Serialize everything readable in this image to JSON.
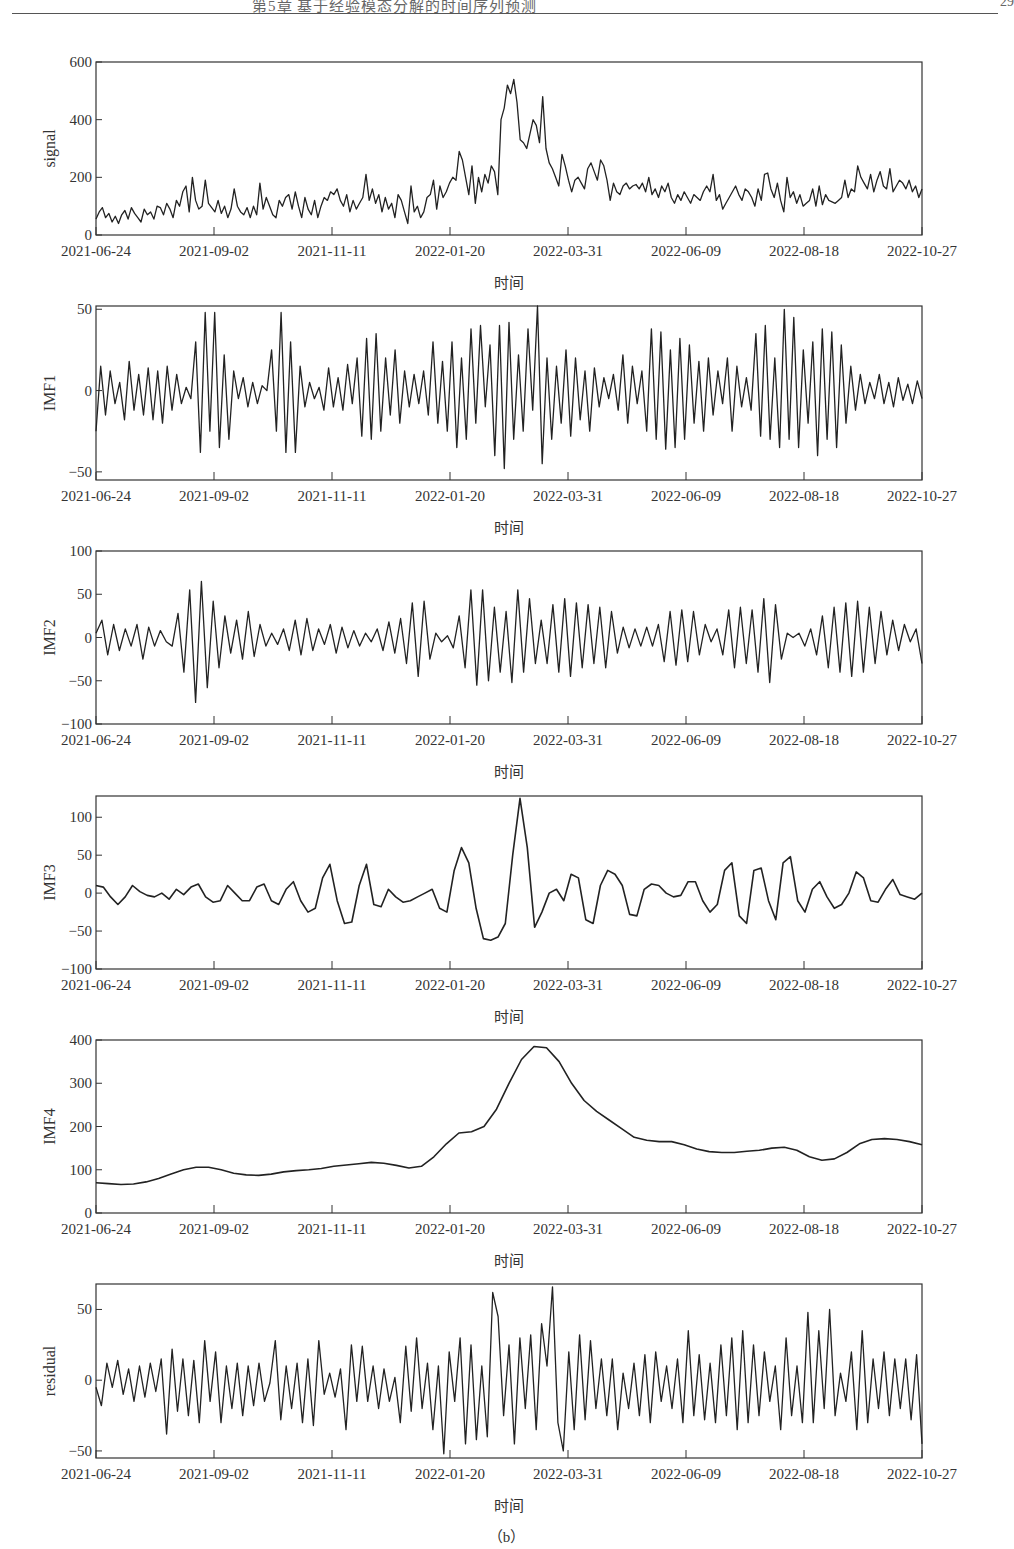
{
  "page_header": {
    "text": "第5章  基于经验模态分解的时间序列预测",
    "page_number": "29"
  },
  "figure_caption": "（b）",
  "chart_data": [
    {
      "type": "line",
      "id": "signal",
      "ylabel": "signal",
      "xlabel": "时间",
      "ylim": [
        0,
        600
      ],
      "yticks": [
        0,
        200,
        400,
        600
      ],
      "xticks": [
        "2021-06-24",
        "2021-09-02",
        "2021-11-11",
        "2022-01-20",
        "2022-03-31",
        "2022-06-09",
        "2022-08-18",
        "2022-10-27"
      ],
      "x_range": [
        "2021-06-24",
        "2022-10-27"
      ],
      "description": "Raw signal: ~50-150 through 2021, rising to ~200-300 in Jan 2022, peak ~540 in late Feb 2022, decaying to ~150-200 by May 2022, then fluctuating ~100-230 thereafter",
      "values": [
        55,
        80,
        95,
        60,
        75,
        45,
        65,
        40,
        70,
        85,
        55,
        95,
        75,
        60,
        45,
        90,
        70,
        80,
        55,
        100,
        95,
        70,
        110,
        90,
        60,
        120,
        100,
        150,
        170,
        80,
        200,
        120,
        90,
        100,
        190,
        110,
        95,
        80,
        120,
        75,
        100,
        60,
        90,
        160,
        100,
        80,
        70,
        95,
        60,
        100,
        70,
        180,
        90,
        130,
        100,
        70,
        60,
        120,
        100,
        130,
        140,
        90,
        150,
        100,
        60,
        130,
        90,
        70,
        120,
        60,
        100,
        130,
        120,
        150,
        140,
        160,
        120,
        100,
        140,
        80,
        120,
        90,
        110,
        130,
        210,
        120,
        160,
        110,
        140,
        80,
        130,
        90,
        110,
        60,
        140,
        120,
        80,
        40,
        170,
        80,
        100,
        60,
        80,
        130,
        140,
        190,
        90,
        170,
        130,
        150,
        180,
        200,
        190,
        290,
        260,
        200,
        140,
        240,
        110,
        200,
        150,
        210,
        180,
        240,
        220,
        140,
        400,
        440,
        520,
        490,
        540,
        460,
        330,
        320,
        300,
        350,
        400,
        380,
        320,
        480,
        300,
        250,
        230,
        200,
        170,
        280,
        240,
        190,
        150,
        190,
        200,
        180,
        160,
        230,
        250,
        220,
        190,
        260,
        240,
        190,
        120,
        180,
        150,
        140,
        170,
        180,
        160,
        170,
        175,
        160,
        180,
        150,
        200,
        140,
        160,
        130,
        170,
        150,
        180,
        130,
        110,
        140,
        120,
        150,
        130,
        110,
        140,
        130,
        120,
        150,
        170,
        150,
        210,
        120,
        140,
        90,
        110,
        130,
        150,
        170,
        140,
        120,
        160,
        150,
        130,
        100,
        160,
        120,
        210,
        215,
        160,
        130,
        180,
        120,
        80,
        200,
        130,
        150,
        110,
        140,
        100,
        110,
        120,
        160,
        100,
        170,
        105,
        140,
        120,
        115,
        110,
        120,
        130,
        190,
        130,
        160,
        150,
        240,
        200,
        180,
        160,
        210,
        150,
        190,
        220,
        170,
        160,
        230,
        150,
        170,
        190,
        180,
        160,
        190,
        150,
        170,
        130,
        160
      ]
    },
    {
      "type": "line",
      "id": "imf1",
      "ylabel": "IMF1",
      "xlabel": "时间",
      "ylim": [
        -55,
        52
      ],
      "yticks": [
        -50,
        0,
        50
      ],
      "xticks": [
        "2021-06-24",
        "2021-09-02",
        "2021-11-11",
        "2022-01-20",
        "2022-03-31",
        "2022-06-09",
        "2022-08-18",
        "2022-10-27"
      ],
      "description": "High-frequency oscillation roughly ±20, bursts to ±50 near 2021-08/09, 2022-02/03 and 2022-08",
      "values": [
        -25,
        15,
        -15,
        12,
        -8,
        5,
        -18,
        18,
        -12,
        10,
        -15,
        14,
        -18,
        12,
        -20,
        15,
        -12,
        10,
        -8,
        2,
        -5,
        30,
        -38,
        48,
        -25,
        48,
        -35,
        22,
        -30,
        12,
        -5,
        8,
        -10,
        5,
        -8,
        3,
        0,
        25,
        -25,
        48,
        -38,
        30,
        -38,
        15,
        -10,
        5,
        -5,
        2,
        -12,
        14,
        -10,
        8,
        -12,
        16,
        -8,
        20,
        -28,
        32,
        -30,
        35,
        -25,
        20,
        -15,
        25,
        -20,
        12,
        -10,
        10,
        -8,
        12,
        -15,
        30,
        -20,
        18,
        -25,
        30,
        -35,
        20,
        -30,
        38,
        -20,
        40,
        -10,
        28,
        -40,
        40,
        -48,
        42,
        -30,
        22,
        -25,
        38,
        -12,
        52,
        -45,
        20,
        -30,
        15,
        -20,
        25,
        -28,
        20,
        -18,
        12,
        -25,
        14,
        -10,
        8,
        -5,
        10,
        -12,
        22,
        -20,
        15,
        -8,
        12,
        -25,
        38,
        -30,
        36,
        -36,
        25,
        -35,
        32,
        -30,
        28,
        -20,
        18,
        -25,
        20,
        -15,
        12,
        -8,
        20,
        -25,
        15,
        -10,
        8,
        -12,
        35,
        -28,
        40,
        -30,
        20,
        -35,
        50,
        -30,
        45,
        -35,
        25,
        -20,
        30,
        -40,
        38,
        -30,
        36,
        -35,
        28,
        -20,
        15,
        -12,
        10,
        -8,
        5,
        -5,
        10,
        -8,
        5,
        -10,
        8,
        -6,
        4,
        -8,
        6,
        -5
      ]
    },
    {
      "type": "line",
      "id": "imf2",
      "ylabel": "IMF2",
      "xlabel": "时间",
      "ylim": [
        -100,
        100
      ],
      "yticks": [
        -100,
        -50,
        0,
        50,
        100
      ],
      "xticks": [
        "2021-06-24",
        "2021-09-02",
        "2021-11-11",
        "2022-01-20",
        "2022-03-31",
        "2022-06-09",
        "2022-08-18",
        "2022-10-27"
      ],
      "description": "Mid-frequency oscillation; burst ±70 around 2021-08, amplitude ~±50 from 2022-01 onward",
      "values": [
        5,
        20,
        -20,
        15,
        -15,
        10,
        -10,
        15,
        -25,
        12,
        -10,
        8,
        -5,
        -10,
        28,
        -40,
        55,
        -75,
        65,
        -58,
        42,
        -35,
        25,
        -18,
        20,
        -25,
        30,
        -22,
        15,
        -10,
        5,
        -8,
        10,
        -15,
        20,
        -20,
        22,
        -15,
        10,
        -8,
        15,
        -18,
        12,
        -12,
        8,
        -10,
        5,
        -5,
        10,
        -15,
        18,
        -18,
        22,
        -30,
        40,
        -45,
        42,
        -25,
        5,
        -5,
        2,
        -12,
        25,
        -35,
        55,
        -55,
        55,
        -50,
        35,
        -40,
        30,
        -52,
        55,
        -40,
        45,
        -30,
        20,
        -30,
        38,
        -40,
        45,
        -45,
        40,
        -35,
        38,
        -30,
        35,
        -35,
        30,
        -18,
        12,
        -12,
        10,
        -10,
        12,
        -10,
        15,
        -28,
        30,
        -32,
        32,
        -28,
        30,
        -20,
        15,
        -5,
        10,
        -20,
        32,
        -35,
        35,
        -30,
        32,
        -40,
        45,
        -52,
        38,
        -25,
        5,
        0,
        5,
        -10,
        10,
        -20,
        25,
        -35,
        35,
        -40,
        40,
        -45,
        42,
        -40,
        35,
        -30,
        30,
        -20,
        20,
        -15,
        15,
        -5,
        10,
        -30
      ]
    },
    {
      "type": "line",
      "id": "imf3",
      "ylabel": "IMF3",
      "xlabel": "时间",
      "ylim": [
        -100,
        128
      ],
      "yticks": [
        -100,
        -50,
        0,
        50,
        100
      ],
      "xticks": [
        "2021-06-24",
        "2021-09-02",
        "2021-11-11",
        "2022-01-20",
        "2022-03-31",
        "2022-06-09",
        "2022-08-18",
        "2022-10-27"
      ],
      "description": "Lower-frequency oscillation; peaks ~60 (2022-01-22), ~125 (2022-02-25), trough ~-62 (2022-02-08)",
      "values": [
        10,
        8,
        -5,
        -15,
        -5,
        10,
        2,
        -3,
        -5,
        0,
        -8,
        5,
        -2,
        8,
        12,
        -5,
        -12,
        -10,
        10,
        0,
        -10,
        -10,
        8,
        12,
        -10,
        -15,
        5,
        15,
        -10,
        -25,
        -20,
        20,
        38,
        -10,
        -40,
        -38,
        10,
        38,
        -15,
        -18,
        5,
        -5,
        -12,
        -10,
        -5,
        0,
        5,
        -20,
        -25,
        30,
        60,
        40,
        -20,
        -60,
        -62,
        -58,
        -40,
        50,
        125,
        60,
        -45,
        -25,
        0,
        5,
        -10,
        25,
        20,
        -35,
        -40,
        10,
        30,
        25,
        10,
        -28,
        -30,
        5,
        12,
        10,
        0,
        -5,
        -3,
        15,
        15,
        -10,
        -25,
        -15,
        30,
        40,
        -30,
        -40,
        30,
        33,
        -10,
        -35,
        40,
        48,
        -10,
        -25,
        5,
        15,
        -5,
        -20,
        -15,
        0,
        28,
        20,
        -10,
        -12,
        5,
        18,
        -2,
        -5,
        -8,
        0
      ]
    },
    {
      "type": "line",
      "id": "imf4",
      "ylabel": "IMF4",
      "xlabel": "时间",
      "ylim": [
        0,
        400
      ],
      "yticks": [
        0,
        100,
        200,
        300,
        400
      ],
      "xticks": [
        "2021-06-24",
        "2021-09-02",
        "2021-11-11",
        "2022-01-20",
        "2022-03-31",
        "2022-06-09",
        "2022-08-18",
        "2022-10-27"
      ],
      "description": "Smooth trend: ~70 mid-2021, ~105 Sept 2021, ~115 Dec 2021, rising to ~185 late Jan 2022, peak ~385 early March 2022, declining to ~165 by May, ~140 Jun-Jul, ~120 early Sept, ~170 Oct, ~158 end",
      "values": [
        70,
        68,
        66,
        67,
        72,
        80,
        90,
        100,
        106,
        106,
        100,
        92,
        88,
        87,
        90,
        95,
        98,
        100,
        103,
        108,
        111,
        114,
        117,
        115,
        110,
        104,
        108,
        130,
        160,
        185,
        188,
        200,
        240,
        300,
        355,
        385,
        382,
        350,
        300,
        260,
        235,
        215,
        195,
        175,
        168,
        165,
        165,
        158,
        148,
        142,
        140,
        140,
        143,
        145,
        150,
        152,
        145,
        130,
        122,
        125,
        140,
        160,
        170,
        172,
        170,
        165,
        158
      ]
    },
    {
      "type": "line",
      "id": "residual",
      "ylabel": "residual",
      "xlabel": "时间",
      "ylim": [
        -55,
        68
      ],
      "yticks": [
        -50,
        0,
        50
      ],
      "xticks": [
        "2021-06-24",
        "2021-09-02",
        "2021-11-11",
        "2022-01-20",
        "2022-03-31",
        "2022-06-09",
        "2022-08-18",
        "2022-10-27"
      ],
      "description": "Noisy residual ±20 typical, spikes to ~+62 (2022-02), ~+66 (2022-03), ~-52 (2022-03)",
      "values": [
        -5,
        -18,
        12,
        -5,
        14,
        -10,
        8,
        -15,
        10,
        -12,
        12,
        -8,
        15,
        -38,
        22,
        -22,
        15,
        -25,
        14,
        -30,
        28,
        -15,
        20,
        -30,
        10,
        -20,
        12,
        -25,
        10,
        -18,
        12,
        -15,
        -2,
        28,
        -28,
        10,
        -20,
        12,
        -30,
        15,
        -32,
        28,
        -10,
        5,
        -12,
        8,
        -35,
        25,
        -15,
        24,
        -15,
        10,
        -20,
        8,
        -15,
        2,
        -30,
        24,
        -22,
        30,
        -20,
        12,
        -35,
        10,
        -52,
        20,
        -15,
        30,
        -45,
        25,
        -42,
        10,
        -40,
        62,
        45,
        -25,
        25,
        -45,
        30,
        -20,
        32,
        -35,
        40,
        10,
        66,
        -30,
        -50,
        20,
        -35,
        32,
        -28,
        28,
        -20,
        15,
        -25,
        15,
        -35,
        5,
        -20,
        12,
        -25,
        18,
        -30,
        20,
        -15,
        10,
        -20,
        15,
        -30,
        35,
        -25,
        18,
        -28,
        12,
        -30,
        25,
        -25,
        30,
        -35,
        35,
        -30,
        25,
        -25,
        20,
        -15,
        10,
        -35,
        30,
        -25,
        10,
        -30,
        48,
        -30,
        35,
        -20,
        50,
        -25,
        5,
        -15,
        20,
        -35,
        35,
        -30,
        15,
        -20,
        20,
        -25,
        15,
        -20,
        15,
        -28,
        18,
        -45
      ]
    }
  ],
  "panels_layout": {
    "plot_left": 96,
    "plot_right": 922,
    "panels": [
      {
        "top": 62,
        "bottom": 235
      },
      {
        "top": 306,
        "bottom": 480
      },
      {
        "top": 551,
        "bottom": 724
      },
      {
        "top": 796,
        "bottom": 969
      },
      {
        "top": 1040,
        "bottom": 1213
      },
      {
        "top": 1284,
        "bottom": 1458
      }
    ]
  }
}
